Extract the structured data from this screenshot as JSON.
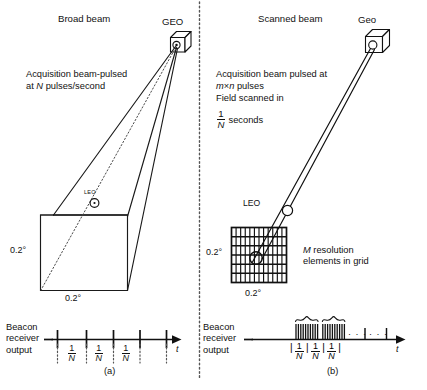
{
  "figure": {
    "caption_a": "(a)",
    "caption_b": "(b)"
  },
  "panel_a": {
    "title": "Broad beam",
    "satellite_label": "GEO",
    "satellite_icon": "satellite-cube-icon",
    "description_line1": "Acquisition beam-pulsed",
    "description_line2_pre": "at ",
    "description_line2_var": "N",
    "description_line2_post": " pulses/second",
    "leo_label": "LEO",
    "angle_vertical": "0.2°",
    "angle_horizontal": "0.2°",
    "waveform": {
      "axis_label": "t",
      "y_label_line1": "Beacon",
      "y_label_line2": "receiver",
      "y_label_line3": "output",
      "tick_count": 5,
      "interval_labels": [
        "1/N",
        "1/N",
        "1/N"
      ],
      "fraction_numerator": "1",
      "fraction_denominator": "N"
    }
  },
  "panel_b": {
    "title": "Scanned beam",
    "satellite_label": "Geo",
    "satellite_icon": "satellite-cube-icon",
    "description_line1": "Acquisition beam pulsed at",
    "description_line2_var1": "m",
    "description_line2_times": "×",
    "description_line2_var2": "n",
    "description_line2_post": " pulses",
    "description_line3": "Field scanned in",
    "description_line4_post": " seconds",
    "leo_label": "LEO",
    "angle_vertical": "0.2°",
    "angle_horizontal": "0.2°",
    "grid": {
      "columns": 12,
      "rows": 6,
      "annotation_var": "M",
      "annotation_line1_post": " resolution",
      "annotation_line2": "elements in grid"
    },
    "waveform": {
      "axis_label": "t",
      "y_label_line1": "Beacon",
      "y_label_line2": "receiver",
      "y_label_line3": "output",
      "burst_count": 2,
      "pulses_per_burst": 10,
      "ellipsis": "· · ·",
      "interval_labels": [
        "1/N",
        "1/N",
        "1/N"
      ],
      "delimiter": "|",
      "fraction_numerator": "1",
      "fraction_denominator": "N"
    }
  },
  "colors": {
    "ink": "#111111",
    "line": "#1a1a1a",
    "dotted": "#4a4a4a",
    "background": "#ffffff"
  }
}
